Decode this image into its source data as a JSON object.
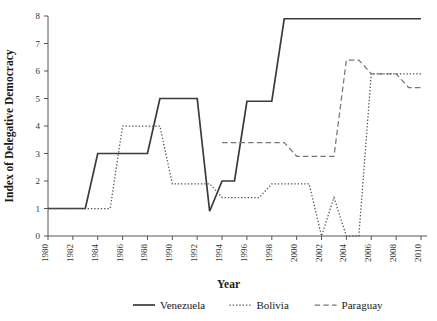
{
  "chart_data": {
    "type": "line",
    "title": "",
    "xlabel": "Year",
    "ylabel": "Index of Delegative Democracy",
    "xlim": [
      1980,
      2010
    ],
    "ylim": [
      0,
      8
    ],
    "grid": false,
    "legend_position": "bottom",
    "xticks": [
      1980,
      1982,
      1984,
      1986,
      1988,
      1990,
      1992,
      1994,
      1996,
      1998,
      2000,
      2002,
      2004,
      2006,
      2008,
      2010
    ],
    "xtick_labels": [
      "1980",
      "1982",
      "1984",
      "1986",
      "1988",
      "1990",
      "1992",
      "1994",
      "1996",
      "1998",
      "2000",
      "2002",
      "2004",
      "2006",
      "2008",
      "2010"
    ],
    "yticks": [
      0,
      1,
      2,
      3,
      4,
      5,
      6,
      7,
      8
    ],
    "ytick_labels": [
      "0",
      "1",
      "2",
      "3",
      "4",
      "5",
      "6",
      "7",
      "8"
    ],
    "series": [
      {
        "name": "Venezuela",
        "style": "solid",
        "color": "#3a3a3a",
        "x": [
          1980,
          1981,
          1982,
          1983,
          1984,
          1985,
          1986,
          1987,
          1988,
          1989,
          1990,
          1991,
          1992,
          1993,
          1994,
          1995,
          1996,
          1997,
          1998,
          1999,
          2000,
          2001,
          2002,
          2003,
          2004,
          2005,
          2006,
          2007,
          2008,
          2009,
          2010
        ],
        "values": [
          1,
          1,
          1,
          1,
          3,
          3,
          3,
          3,
          3,
          5,
          5,
          5,
          5,
          0.9,
          2,
          2,
          4.9,
          4.9,
          4.9,
          7.9,
          7.9,
          7.9,
          7.9,
          7.9,
          7.9,
          7.9,
          7.9,
          7.9,
          7.9,
          7.9,
          7.9
        ]
      },
      {
        "name": "Bolivia",
        "style": "dotted",
        "color": "#555555",
        "x": [
          1980,
          1981,
          1982,
          1983,
          1984,
          1985,
          1986,
          1987,
          1988,
          1989,
          1990,
          1991,
          1992,
          1993,
          1994,
          1995,
          1996,
          1997,
          1998,
          1999,
          2000,
          2001,
          2002,
          2003,
          2004,
          2005,
          2006,
          2007,
          2008,
          2009,
          2010
        ],
        "values": [
          1,
          1,
          1,
          1,
          1,
          1,
          4,
          4,
          4,
          4,
          1.9,
          1.9,
          1.9,
          1.9,
          1.4,
          1.4,
          1.4,
          1.4,
          1.9,
          1.9,
          1.9,
          1.9,
          0,
          1.4,
          0,
          0,
          5.9,
          5.9,
          5.9,
          5.9,
          5.9
        ]
      },
      {
        "name": "Paraguay",
        "style": "dashed",
        "color": "#777777",
        "x": [
          1994,
          1995,
          1996,
          1997,
          1998,
          1999,
          2000,
          2001,
          2002,
          2003,
          2004,
          2005,
          2006,
          2007,
          2008,
          2009,
          2010
        ],
        "values": [
          3.4,
          3.4,
          3.4,
          3.4,
          3.4,
          3.4,
          2.9,
          2.9,
          2.9,
          2.9,
          6.4,
          6.4,
          5.9,
          5.9,
          5.9,
          5.4,
          5.4
        ]
      }
    ]
  },
  "legend": {
    "items": [
      {
        "label": "Venezuela",
        "style": "solid"
      },
      {
        "label": "Bolivia",
        "style": "dotted"
      },
      {
        "label": "Paraguay",
        "style": "dashed"
      }
    ]
  }
}
